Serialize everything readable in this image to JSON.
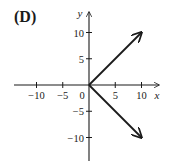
{
  "panel_label": "(D)",
  "chart_data": {
    "type": "line",
    "title": "(D)",
    "xlabel": "x",
    "ylabel": "y",
    "xlim": [
      -14,
      13
    ],
    "ylim": [
      -14,
      13.5
    ],
    "grid": false,
    "legend": null,
    "x_ticks": [
      -10,
      -5,
      0,
      5,
      10
    ],
    "x_tick_labels": [
      "−10",
      "−5",
      "0",
      "5",
      "10"
    ],
    "y_ticks": [
      -10,
      -5,
      5,
      10
    ],
    "y_tick_labels": [
      "−10",
      "−5",
      "5",
      "10"
    ],
    "series": [
      {
        "name": "upper ray",
        "x": [
          0,
          10
        ],
        "y": [
          0,
          10
        ],
        "arrow_end": true
      },
      {
        "name": "lower ray",
        "x": [
          0,
          10
        ],
        "y": [
          0,
          -10
        ],
        "arrow_end": true
      }
    ],
    "annotations": []
  }
}
